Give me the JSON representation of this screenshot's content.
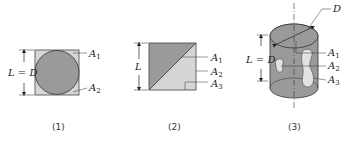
{
  "figures": [
    {
      "caption": "(1)",
      "dimension_label": "L = D",
      "labels": [
        "A",
        "A"
      ],
      "subscripts": [
        "1",
        "2"
      ],
      "description": "Circle inscribed in square"
    },
    {
      "caption": "(2)",
      "dimension_label": "L",
      "labels": [
        "A",
        "A",
        "A"
      ],
      "subscripts": [
        "1",
        "2",
        "3"
      ],
      "description": "Square split along diagonal"
    },
    {
      "caption": "(3)",
      "dimension_label": "L = D",
      "diameter_label": "D",
      "labels": [
        "A",
        "A",
        "A"
      ],
      "subscripts": [
        "1",
        "2",
        "3"
      ],
      "description": "Cylinder with holes"
    }
  ],
  "colors": {
    "dark_fill": "#9a9a9a",
    "light_fill": "#d6d6d6",
    "line": "#333333"
  }
}
